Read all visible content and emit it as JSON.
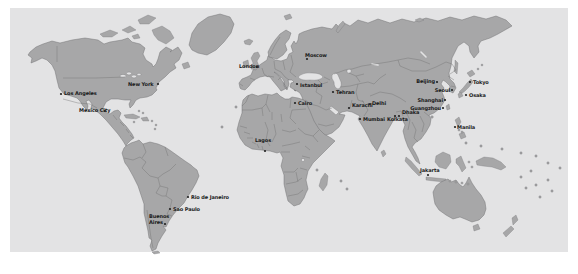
{
  "page": {
    "background": "#ffffff"
  },
  "map": {
    "type": "world-map",
    "colors": {
      "page": "#ffffff",
      "ocean": "#e3e3e4",
      "land": "#a7a7a8",
      "border": "#6e6e70",
      "label": "#1a1a1a",
      "dot": "#222222"
    },
    "cities": [
      {
        "name": "Los Angeles",
        "label_x": 64,
        "label_y": 95,
        "anchor": "start",
        "dot_x": 61,
        "dot_y": 94
      },
      {
        "name": "Mexico City",
        "label_x": 79,
        "label_y": 112,
        "anchor": "start",
        "dot_x": 105,
        "dot_y": 111
      },
      {
        "name": "New York",
        "label_x": 128,
        "label_y": 86,
        "anchor": "start",
        "dot_x": 158,
        "dot_y": 84
      },
      {
        "name": "London",
        "label_x": 239,
        "label_y": 68,
        "anchor": "start",
        "dot_x": 257,
        "dot_y": 67
      },
      {
        "name": "Moscow",
        "label_x": 305,
        "label_y": 57,
        "anchor": "start",
        "dot_x": 307,
        "dot_y": 59
      },
      {
        "name": "Istanbul",
        "label_x": 300,
        "label_y": 87,
        "anchor": "start",
        "dot_x": 297,
        "dot_y": 84
      },
      {
        "name": "Cairo",
        "label_x": 298,
        "label_y": 105,
        "anchor": "start",
        "dot_x": 295,
        "dot_y": 103
      },
      {
        "name": "Tehran",
        "label_x": 336,
        "label_y": 94,
        "anchor": "start",
        "dot_x": 333,
        "dot_y": 92
      },
      {
        "name": "Karachi",
        "label_x": 352,
        "label_y": 107,
        "anchor": "start",
        "dot_x": 349,
        "dot_y": 108
      },
      {
        "name": "Delhi",
        "label_x": 372,
        "label_y": 105,
        "anchor": "start",
        "dot_x": 370,
        "dot_y": 104
      },
      {
        "name": "Mumbai",
        "label_x": 363,
        "label_y": 121,
        "anchor": "start",
        "dot_x": 360,
        "dot_y": 119
      },
      {
        "name": "Kolkata",
        "label_x": 387,
        "label_y": 121,
        "anchor": "start",
        "dot_x": 395,
        "dot_y": 116
      },
      {
        "name": "Dhaka",
        "label_x": 402,
        "label_y": 114,
        "anchor": "start",
        "dot_x": 399,
        "dot_y": 116
      },
      {
        "name": "Beijing",
        "label_x": 435,
        "label_y": 83,
        "anchor": "end",
        "dot_x": 437,
        "dot_y": 82
      },
      {
        "name": "Seoul",
        "label_x": 450,
        "label_y": 92,
        "anchor": "end",
        "dot_x": 452,
        "dot_y": 90
      },
      {
        "name": "Tokyo",
        "label_x": 473,
        "label_y": 84,
        "anchor": "start",
        "dot_x": 470,
        "dot_y": 82
      },
      {
        "name": "Osaka",
        "label_x": 469,
        "label_y": 97,
        "anchor": "start",
        "dot_x": 466,
        "dot_y": 95
      },
      {
        "name": "Shanghai",
        "label_x": 443,
        "label_y": 102,
        "anchor": "end",
        "dot_x": 445,
        "dot_y": 100
      },
      {
        "name": "Guangzhou",
        "label_x": 441,
        "label_y": 110,
        "anchor": "end",
        "dot_x": 443,
        "dot_y": 108
      },
      {
        "name": "Manila",
        "label_x": 457,
        "label_y": 129,
        "anchor": "start",
        "dot_x": 455,
        "dot_y": 127
      },
      {
        "name": "Jakarta",
        "label_x": 420,
        "label_y": 172,
        "anchor": "start",
        "dot_x": 428,
        "dot_y": 175
      },
      {
        "name": "Lagos",
        "label_x": 255,
        "label_y": 142,
        "anchor": "start",
        "dot_x": 265,
        "dot_y": 151
      },
      {
        "name": "Rio de Janeiro",
        "label_x": 191,
        "label_y": 199,
        "anchor": "start",
        "dot_x": 188,
        "dot_y": 197
      },
      {
        "name": "Sao Paulo",
        "label_x": 173,
        "label_y": 211,
        "anchor": "start",
        "dot_x": 170,
        "dot_y": 209
      },
      {
        "name": "Buenos Aires",
        "lines": [
          "Buenos",
          "Aires"
        ],
        "label_x": 149,
        "label_y": 218,
        "anchor": "start",
        "dot_x": 165,
        "dot_y": 224
      }
    ]
  }
}
